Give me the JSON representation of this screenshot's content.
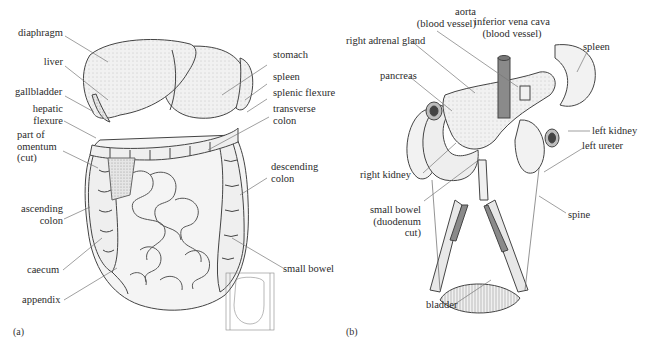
{
  "figure": {
    "panels": [
      {
        "id": "a",
        "tag": "(a)",
        "subject": "abdominal organs, front view",
        "labels": {
          "diaphragm": "diaphragm",
          "liver": "liver",
          "gallbladder": "gallbladder",
          "hepatic_flexure": "hepatic\nflexure",
          "omentum": "part of\nomentum\n(cut)",
          "ascending_colon": "ascending\ncolon",
          "caecum": "caecum",
          "appendix": "appendix",
          "stomach": "stomach",
          "spleen": "spleen",
          "splenic_flexure": "splenic flexure",
          "transverse_colon": "transverse\ncolon",
          "descending_colon": "descending\ncolon",
          "small_bowel": "small bowel"
        }
      },
      {
        "id": "b",
        "tag": "(b)",
        "subject": "posterior abdominal organs",
        "labels": {
          "aorta": "aorta\n(blood vessel)",
          "vena_cava": "inferior vena cava\n(blood vessel)",
          "right_adrenal": "right adrenal gland",
          "pancreas": "pancreas",
          "spleen": "spleen",
          "left_kidney": "left kidney",
          "left_ureter": "left ureter",
          "right_kidney": "right kidney",
          "small_bowel": "small bowel\n(duodenum\ncut)",
          "spine": "spine",
          "bladder": "bladder"
        }
      }
    ],
    "colors": {
      "line": "#555555",
      "organ_fill": "#eeeeee",
      "vessel_fill": "#8a8a8a",
      "text": "#2b2b2b"
    }
  }
}
